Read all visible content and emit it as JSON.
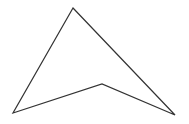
{
  "canvas": {
    "width": 189,
    "height": 124,
    "background": "#ffffff"
  },
  "shape": {
    "type": "polygon",
    "description": "concave quadrilateral (arrowhead / dart)",
    "stroke": "#333333",
    "stroke_width": 1.2,
    "fill": "none",
    "points": [
      [
        73,
        8
      ],
      [
        175,
        115
      ],
      [
        102,
        84
      ],
      [
        13,
        113
      ]
    ]
  }
}
